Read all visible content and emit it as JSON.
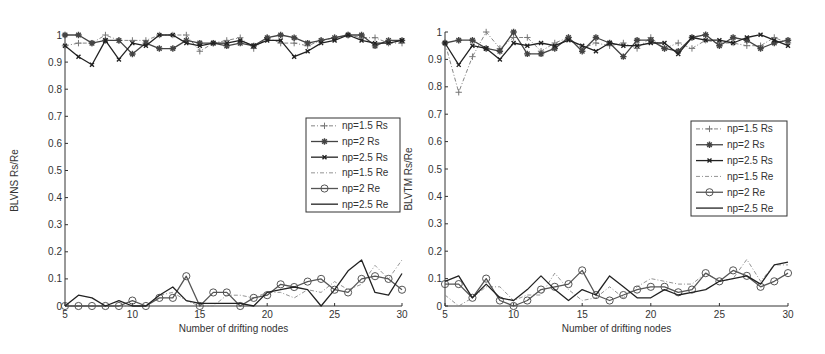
{
  "chart_data": [
    {
      "type": "line",
      "title": "",
      "xlabel": "Number of drifting nodes",
      "ylabel": "BLVNS Rs/Re",
      "xlim": [
        5,
        30
      ],
      "ylim": [
        0,
        1
      ],
      "xticks": [
        5,
        10,
        15,
        20,
        25,
        30
      ],
      "yticks": [
        0,
        0.1,
        0.2,
        0.3,
        0.4,
        0.5,
        0.6,
        0.7,
        0.8,
        0.9,
        1
      ],
      "ytick_labels": [
        "0",
        "0.1",
        "0.2",
        "0.3",
        "0.4",
        "0.5",
        "0.6",
        "0.7",
        "0.8",
        "0.9",
        "1"
      ],
      "grid": false,
      "legend_position": "right-middle",
      "x": [
        5,
        6,
        7,
        8,
        9,
        10,
        11,
        12,
        13,
        14,
        15,
        16,
        17,
        18,
        19,
        20,
        21,
        22,
        23,
        24,
        25,
        26,
        27,
        28,
        29,
        30
      ],
      "series": [
        {
          "name": "np=1.5 Rs",
          "marker": "plus",
          "style": "dashdot",
          "color": "#777777",
          "values": [
            0.96,
            0.97,
            0.97,
            1.0,
            0.98,
            0.98,
            0.98,
            1.0,
            1.0,
            1.0,
            0.94,
            0.97,
            0.98,
            0.99,
            0.95,
            0.99,
            0.97,
            0.97,
            0.96,
            0.98,
            0.99,
            1.0,
            0.99,
            0.99,
            0.97,
            0.97
          ]
        },
        {
          "name": "np=2 Rs",
          "marker": "star",
          "style": "solid",
          "color": "#444444",
          "values": [
            1.0,
            1.0,
            0.97,
            0.98,
            0.98,
            0.93,
            0.97,
            0.95,
            0.95,
            0.98,
            0.97,
            0.97,
            0.96,
            0.97,
            0.96,
            0.99,
            1.0,
            0.99,
            0.97,
            0.98,
            0.99,
            1.0,
            1.0,
            0.96,
            0.98,
            0.98
          ]
        },
        {
          "name": "np=2.5 Rs",
          "marker": "x",
          "style": "solid",
          "color": "#222222",
          "values": [
            0.96,
            0.92,
            0.89,
            0.98,
            0.91,
            0.97,
            0.96,
            1.0,
            1.0,
            0.97,
            0.96,
            0.97,
            0.97,
            0.98,
            0.96,
            0.98,
            0.98,
            0.92,
            0.94,
            0.97,
            0.98,
            1.0,
            0.98,
            0.97,
            0.97,
            0.98
          ]
        },
        {
          "name": "np=1.5 Re",
          "marker": "none",
          "style": "dashdot",
          "color": "#888888",
          "values": [
            0.0,
            0.0,
            0.0,
            0.0,
            0.0,
            0.0,
            0.0,
            0.04,
            0.05,
            0.02,
            0.0,
            0.0,
            0.04,
            0.04,
            0.03,
            0.05,
            0.05,
            0.03,
            0.06,
            0.05,
            0.09,
            0.06,
            0.08,
            0.15,
            0.1,
            0.17
          ]
        },
        {
          "name": "np=2 Re",
          "marker": "circle",
          "style": "solid",
          "color": "#555555",
          "values": [
            0.0,
            0.0,
            0.0,
            0.0,
            0.0,
            0.02,
            0.0,
            0.03,
            0.03,
            0.11,
            0.0,
            0.05,
            0.05,
            0.0,
            0.03,
            0.04,
            0.08,
            0.07,
            0.09,
            0.1,
            0.06,
            0.05,
            0.1,
            0.11,
            0.1,
            0.06
          ]
        },
        {
          "name": "np=2.5 Re",
          "marker": "none",
          "style": "solid",
          "color": "#222222",
          "values": [
            0.0,
            0.04,
            0.03,
            0.0,
            0.02,
            0.0,
            0.0,
            0.04,
            0.07,
            0.02,
            0.01,
            0.01,
            0.01,
            0.01,
            0.0,
            0.05,
            0.06,
            0.07,
            0.06,
            0.0,
            0.06,
            0.13,
            0.17,
            0.05,
            0.04,
            0.12
          ]
        }
      ]
    },
    {
      "type": "line",
      "title": "",
      "xlabel": "Number of drifting nodes",
      "ylabel": "BLVTM Rs/Re",
      "xlim": [
        5,
        30
      ],
      "ylim": [
        0,
        1
      ],
      "xticks": [
        5,
        10,
        15,
        20,
        25,
        30
      ],
      "yticks": [
        0,
        0.1,
        0.2,
        0.3,
        0.4,
        0.5,
        0.6,
        0.7,
        0.8,
        0.9,
        1
      ],
      "ytick_labels": [
        "0",
        "0.1",
        "0.2",
        "0.3",
        "0.4",
        "0.5",
        "0.6",
        "0.7",
        "0.8",
        "0.9",
        "1"
      ],
      "grid": false,
      "legend_position": "right-middle",
      "x": [
        5,
        6,
        7,
        8,
        9,
        10,
        11,
        12,
        13,
        14,
        15,
        16,
        17,
        18,
        19,
        20,
        21,
        22,
        23,
        24,
        25,
        26,
        27,
        28,
        29,
        30
      ],
      "series": [
        {
          "name": "np=1.5 Rs",
          "marker": "plus",
          "style": "dashdot",
          "color": "#777777",
          "values": [
            0.96,
            0.78,
            0.91,
            1.0,
            0.94,
            0.98,
            0.98,
            0.93,
            0.96,
            0.98,
            0.94,
            0.96,
            0.95,
            0.96,
            0.94,
            0.98,
            0.94,
            0.96,
            0.94,
            0.97,
            0.96,
            0.96,
            0.95,
            0.95,
            0.98,
            0.96
          ]
        },
        {
          "name": "np=2 Rs",
          "marker": "star",
          "style": "solid",
          "color": "#444444",
          "values": [
            0.96,
            0.97,
            0.97,
            0.94,
            0.93,
            1.0,
            0.92,
            0.92,
            0.94,
            0.98,
            0.93,
            0.98,
            0.96,
            0.91,
            0.97,
            0.97,
            0.94,
            0.93,
            0.98,
            0.99,
            0.95,
            0.98,
            0.97,
            0.94,
            0.96,
            0.97
          ]
        },
        {
          "name": "np=2.5 Rs",
          "marker": "x",
          "style": "solid",
          "color": "#222222",
          "values": [
            0.96,
            0.88,
            0.95,
            0.94,
            0.9,
            0.96,
            0.95,
            0.96,
            0.95,
            0.97,
            0.95,
            0.93,
            0.96,
            0.95,
            0.95,
            0.96,
            0.96,
            0.92,
            0.98,
            0.97,
            0.97,
            0.96,
            0.98,
            0.99,
            0.97,
            0.95
          ]
        },
        {
          "name": "np=1.5 Re",
          "marker": "none",
          "style": "dashdot",
          "color": "#888888",
          "values": [
            0.04,
            0.0,
            0.03,
            0.07,
            0.07,
            0.02,
            0.04,
            0.04,
            0.12,
            0.06,
            0.02,
            0.03,
            0.07,
            0.03,
            0.07,
            0.1,
            0.09,
            0.08,
            0.08,
            0.12,
            0.09,
            0.1,
            0.17,
            0.09,
            0.15,
            0.15
          ]
        },
        {
          "name": "np=2 Re",
          "marker": "circle",
          "style": "solid",
          "color": "#555555",
          "values": [
            0.08,
            0.08,
            0.03,
            0.1,
            0.02,
            0.0,
            0.02,
            0.06,
            0.07,
            0.08,
            0.13,
            0.04,
            0.02,
            0.04,
            0.06,
            0.07,
            0.07,
            0.05,
            0.06,
            0.12,
            0.09,
            0.13,
            0.11,
            0.07,
            0.09,
            0.12
          ]
        },
        {
          "name": "np=2.5 Re",
          "marker": "none",
          "style": "solid",
          "color": "#222222",
          "values": [
            0.09,
            0.11,
            0.03,
            0.08,
            0.03,
            0.02,
            0.06,
            0.11,
            0.06,
            0.02,
            0.06,
            0.04,
            0.11,
            0.07,
            0.03,
            0.03,
            0.06,
            0.04,
            0.05,
            0.06,
            0.09,
            0.1,
            0.11,
            0.08,
            0.15,
            0.16
          ]
        }
      ]
    }
  ],
  "layout": {
    "panels": [
      {
        "x0px": 65,
        "x1px": 402,
        "y0px": 306,
        "y1px": 35,
        "legend": {
          "x": 306,
          "y": 118,
          "w": 94,
          "h": 94
        },
        "ylabel_x": 18
      },
      {
        "x0px": 445,
        "x1px": 788,
        "y0px": 306,
        "y1px": 32,
        "legend": {
          "x": 691,
          "y": 121,
          "w": 96,
          "h": 95
        },
        "ylabel_x": 412
      }
    ]
  }
}
